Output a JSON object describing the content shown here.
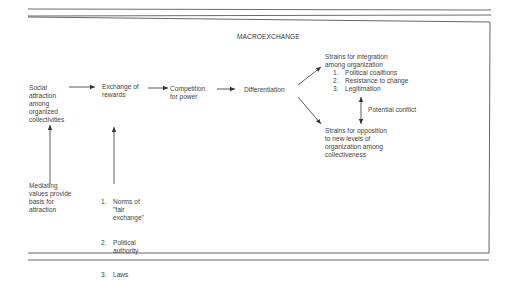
{
  "diagram": {
    "title": "MACROEXCHANGE",
    "nodes": {
      "social_attraction": "Social\nattraction\namong\norganized\ncollectivities",
      "exchange_rewards": "Exchange of\nrewards",
      "competition": "Competition\nfor power",
      "differentiation": "Differentiation",
      "strains_integration": {
        "heading": "Strains for integration\namong organization",
        "items": [
          {
            "num": "1.",
            "text": "Political coalitions"
          },
          {
            "num": "2.",
            "text": "Resistance to change"
          },
          {
            "num": "3.",
            "text": "Legitimation"
          }
        ]
      },
      "potential_conflict": "Potential conflict",
      "strains_opposition": "Strains for opposition\nto new levels of\norganization among\ncollectiveness",
      "mediating_values": "Mediating\nvalues provide\nbasis for\nattraction",
      "norms_list": {
        "items": [
          {
            "num": "1.",
            "text": "Norms of\n\"fair\nexchange\""
          },
          {
            "num": "2.",
            "text": "Political\nauthority"
          },
          {
            "num": "3.",
            "text": "Laws"
          }
        ]
      }
    },
    "edges": [
      {
        "from": "social_attraction",
        "to": "exchange_rewards"
      },
      {
        "from": "exchange_rewards",
        "to": "competition"
      },
      {
        "from": "competition",
        "to": "differentiation"
      },
      {
        "from": "differentiation",
        "to": "strains_integration"
      },
      {
        "from": "differentiation",
        "to": "strains_opposition"
      },
      {
        "from": "strains_integration",
        "to": "strains_opposition",
        "bidirectional": true,
        "label": "Potential conflict"
      },
      {
        "from": "mediating_values",
        "to": "social_attraction"
      },
      {
        "from": "norms_list",
        "to": "exchange_rewards"
      }
    ],
    "colors": {
      "ink": "#444444",
      "rule": "#6b6b6b",
      "background": "#ffffff"
    }
  }
}
